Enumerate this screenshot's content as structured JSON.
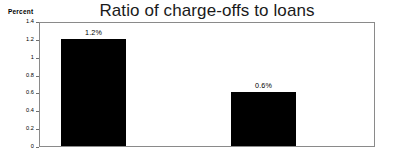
{
  "chart_data": {
    "type": "bar",
    "title": "Ratio of charge-offs to loans",
    "xlabel": "",
    "ylabel": "Percent",
    "ylim": [
      0,
      1.4
    ],
    "grid": false,
    "legend": "none",
    "yticks": [
      "1.4",
      "1.2",
      "1",
      "0.8",
      "0.6",
      "0.4",
      "0.2",
      "0"
    ],
    "ytick_values": [
      1.4,
      1.2,
      1,
      0.8,
      0.6,
      0.4,
      0.2,
      0
    ],
    "categories": [
      "",
      ""
    ],
    "values": [
      1.2,
      0.6
    ],
    "data_labels": [
      "1.2%",
      "0.6%"
    ],
    "bar_color": "#000000",
    "frame_color": "#8a8a8a",
    "background_color": "#ffffff"
  }
}
